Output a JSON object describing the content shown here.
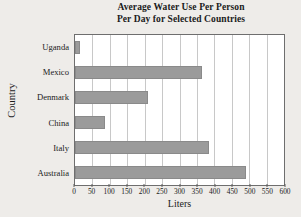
{
  "chart_data": {
    "type": "bar",
    "orientation": "horizontal",
    "title": "Average Water Use Per Person Per Day for Selected Countries",
    "title_lines": [
      "Average Water Use Per Person",
      "Per Day for Selected Countries"
    ],
    "xlabel": "Liters",
    "ylabel": "Country",
    "categories": [
      "Uganda",
      "Mexico",
      "Denmark",
      "China",
      "Italy",
      "Australia"
    ],
    "values": [
      15,
      365,
      210,
      85,
      385,
      490
    ],
    "xlim": [
      0,
      600
    ],
    "xticks": [
      0,
      50,
      100,
      150,
      200,
      250,
      300,
      350,
      400,
      450,
      500,
      550,
      600
    ],
    "xtick_labels": [
      "0",
      "50",
      "100",
      "150",
      "200",
      "250",
      "300",
      "350",
      "400",
      "450",
      "500",
      "550",
      "600"
    ],
    "grid": "vertical",
    "legend": "none",
    "bar_color": "#9b9b9b",
    "plot_background": "#ffffff",
    "page_background": "#eeece9",
    "axis_color": "#6e6e6e",
    "grid_color": "#c8c8c8",
    "text_color": "#1b1b1b"
  }
}
